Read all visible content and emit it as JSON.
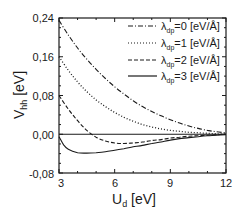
{
  "chart_data": {
    "type": "line",
    "title": "",
    "xlabel": "U_d [eV]",
    "xlabel_main": "U",
    "xlabel_sub": "d",
    "xlabel_unit": " [eV]",
    "ylabel": "V_hh [eV]",
    "ylabel_main": "V",
    "ylabel_sub": "hh",
    "ylabel_unit": " [eV]",
    "xlim": [
      3,
      12
    ],
    "ylim": [
      -0.08,
      0.24
    ],
    "xticks": [
      "3",
      "6",
      "9",
      "12"
    ],
    "yticks": [
      "0,24",
      "0,16",
      "0,08",
      "0,00",
      "-0,08"
    ],
    "grid": false,
    "legend_position": "upper right",
    "zero_line": true,
    "series": [
      {
        "name": "λdp=0 [eV/Å]",
        "label_lambda": "λ",
        "label_sub": "dp",
        "label_rest": "=0 [eV/Å]",
        "style": "dash-dot",
        "x": [
          3,
          3.5,
          4,
          4.5,
          5,
          5.5,
          6,
          6.5,
          7,
          7.5,
          8,
          8.5,
          9,
          9.5,
          10,
          10.5,
          11,
          11.5,
          12
        ],
        "values": [
          0.235,
          0.205,
          0.178,
          0.155,
          0.134,
          0.115,
          0.098,
          0.083,
          0.069,
          0.057,
          0.047,
          0.038,
          0.03,
          0.023,
          0.017,
          0.012,
          0.008,
          0.005,
          0.003
        ]
      },
      {
        "name": "λdp=1 [eV/Å]",
        "label_lambda": "λ",
        "label_sub": "dp",
        "label_rest": "=1 [eV/Å]",
        "style": "dotted",
        "x": [
          3,
          3.5,
          4,
          4.5,
          5,
          5.5,
          6,
          6.5,
          7,
          7.5,
          8,
          8.5,
          9,
          9.5,
          10,
          10.5,
          11,
          11.5,
          12
        ],
        "values": [
          0.16,
          0.132,
          0.108,
          0.088,
          0.071,
          0.057,
          0.045,
          0.035,
          0.027,
          0.02,
          0.015,
          0.011,
          0.008,
          0.006,
          0.004,
          0.003,
          0.002,
          0.001,
          0.001
        ]
      },
      {
        "name": "λdp=2 [eV/Å]",
        "label_lambda": "λ",
        "label_sub": "dp",
        "label_rest": "=2 [eV/Å]",
        "style": "dashed",
        "x": [
          3,
          3.5,
          4,
          4.5,
          5,
          5.5,
          6,
          6.5,
          7,
          7.5,
          8,
          8.5,
          9,
          9.5,
          10,
          10.5,
          11,
          11.5,
          12
        ],
        "values": [
          0.08,
          0.052,
          0.028,
          0.008,
          -0.006,
          -0.014,
          -0.018,
          -0.019,
          -0.018,
          -0.016,
          -0.013,
          -0.011,
          -0.008,
          -0.006,
          -0.004,
          -0.003,
          -0.002,
          -0.001,
          0.0
        ]
      },
      {
        "name": "λdp=3 [eV/Å]",
        "label_lambda": "λ",
        "label_sub": "dp",
        "label_rest": "=3 [eV/Å]",
        "style": "solid",
        "x": [
          3,
          3.25,
          3.5,
          4,
          4.5,
          5,
          5.5,
          6,
          6.5,
          7,
          7.5,
          8,
          8.5,
          9,
          9.5,
          10,
          10.5,
          11,
          11.5,
          12
        ],
        "values": [
          -0.005,
          -0.022,
          -0.031,
          -0.038,
          -0.039,
          -0.038,
          -0.036,
          -0.033,
          -0.03,
          -0.026,
          -0.023,
          -0.019,
          -0.016,
          -0.012,
          -0.009,
          -0.007,
          -0.005,
          -0.003,
          -0.002,
          -0.001
        ]
      }
    ]
  }
}
